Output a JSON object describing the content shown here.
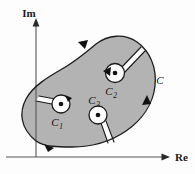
{
  "figure": {
    "background_color": "#fdfdfd",
    "region_fill_color": "#b3b3b3",
    "stroke_color": "#1a1a1a",
    "slit_fill_color": "#fdfdfd"
  },
  "axes": {
    "imaginary": {
      "label": "Im",
      "name": "imaginary-axis",
      "orientation": "vertical",
      "arrow": "up"
    },
    "real": {
      "label": "Re",
      "name": "real-axis",
      "orientation": "horizontal",
      "arrow": "right"
    },
    "origin": {
      "x": 36,
      "y": 157
    }
  },
  "contours": {
    "outer": {
      "label": "C",
      "name": "outer-contour",
      "direction": "counterclockwise",
      "label_position": {
        "x": 160,
        "y": 84
      },
      "arrow_count": 3
    },
    "inner": [
      {
        "label": "C",
        "subscript": "1",
        "name": "inner-contour-c1",
        "center": {
          "x": 61,
          "y": 104
        },
        "radius": 9,
        "direction": "counterclockwise",
        "label_position": {
          "x": 55,
          "y": 126
        },
        "has_singularity_dot": true
      },
      {
        "label": "C",
        "subscript": "2",
        "name": "inner-contour-c2",
        "center": {
          "x": 115,
          "y": 73
        },
        "radius": 9.5,
        "direction": "counterclockwise",
        "label_position": {
          "x": 109,
          "y": 95
        },
        "has_singularity_dot": true
      },
      {
        "label": "C",
        "subscript": "3",
        "name": "inner-contour-c3",
        "center": {
          "x": 98,
          "y": 115
        },
        "radius": 9,
        "direction": "counterclockwise",
        "label_position": {
          "x": 92,
          "y": 104
        },
        "has_singularity_dot": true
      }
    ]
  }
}
